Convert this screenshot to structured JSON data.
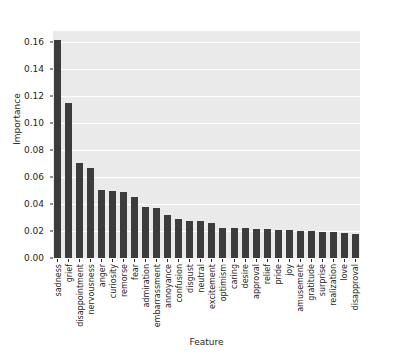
{
  "chart_data": {
    "type": "bar",
    "title": "",
    "xlabel": "Feature",
    "ylabel": "Importance",
    "ylim": [
      0.0,
      0.168
    ],
    "yticks": [
      "0.00",
      "0.02",
      "0.04",
      "0.06",
      "0.08",
      "0.10",
      "0.12",
      "0.14",
      "0.16"
    ],
    "ytick_values": [
      0.0,
      0.02,
      0.04,
      0.06,
      0.08,
      0.1,
      0.12,
      0.14,
      0.16
    ],
    "grid": true,
    "legend": "none",
    "orientation": "vertical",
    "bar_color": "#3c3c3c",
    "plot_background": "#eaeaea",
    "figure_background": "#ffffff",
    "categories": [
      "sadness",
      "grief",
      "disappointment",
      "nervousness",
      "anger",
      "curiosity",
      "remorse",
      "fear",
      "admiration",
      "embarrassment",
      "annoyance",
      "confusion",
      "disgust",
      "neutral",
      "excitement",
      "optimism",
      "caring",
      "desire",
      "approval",
      "relief",
      "pride",
      "joy",
      "amusement",
      "gratitude",
      "surprise",
      "realization",
      "love",
      "disapproval"
    ],
    "values": [
      0.161,
      0.115,
      0.0705,
      0.0665,
      0.0505,
      0.0495,
      0.0485,
      0.0455,
      0.0375,
      0.037,
      0.032,
      0.029,
      0.0275,
      0.0275,
      0.026,
      0.0225,
      0.022,
      0.022,
      0.0215,
      0.0215,
      0.021,
      0.0205,
      0.02,
      0.02,
      0.0195,
      0.019,
      0.0185,
      0.0175
    ]
  }
}
